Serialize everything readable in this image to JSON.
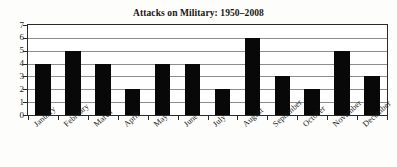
{
  "chart_data": {
    "type": "bar",
    "title": "Attacks on Military: 1950–2008",
    "xlabel": "",
    "ylabel": "",
    "categories": [
      "January",
      "February",
      "March",
      "April",
      "May",
      "June",
      "July",
      "August",
      "September",
      "October",
      "November",
      "December"
    ],
    "values": [
      4,
      5,
      4,
      2,
      4,
      4,
      2,
      6,
      3,
      2,
      5,
      3
    ],
    "ylim": [
      0,
      7
    ],
    "ytick_labels": [
      "7",
      "6",
      "5",
      "4",
      "3",
      "2",
      "1",
      "0"
    ],
    "ytick_values": [
      7,
      6,
      5,
      4,
      3,
      2,
      1,
      0
    ],
    "grid": "horizontal",
    "legend": "none",
    "bar_color": "#080808",
    "grid_color": "#8d8d8d",
    "frame_color": "#2a2a2a",
    "background_color": "#ffffff",
    "title_color": "#17150f"
  }
}
